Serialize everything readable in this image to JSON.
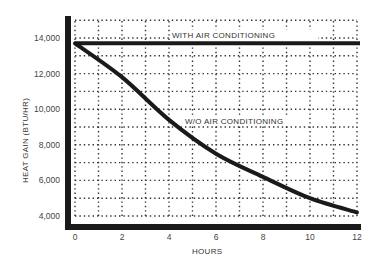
{
  "chart_data": {
    "type": "line",
    "title": "",
    "xlabel": "HOURS",
    "ylabel": "HEAT GAIN (BTU/HR)",
    "xlim": [
      0,
      12
    ],
    "ylim": [
      3600,
      15000
    ],
    "x_ticks": [
      0,
      2,
      4,
      6,
      8,
      10,
      12
    ],
    "x_tick_labels": [
      "0",
      "2",
      "4",
      "6",
      "8",
      "10",
      "12"
    ],
    "y_ticks": [
      4000,
      6000,
      8000,
      10000,
      12000,
      14000
    ],
    "y_tick_labels": [
      "4,000",
      "6,000",
      "8,000",
      "10,000",
      "12,000",
      "14,000"
    ],
    "grid": "dotted, every 1 hour and every 1,000 BTU/HR",
    "legend": "inline labels",
    "x": [
      0,
      2,
      4,
      6,
      8,
      10,
      12
    ],
    "series": [
      {
        "name": "WITH AIR CONDITIONING",
        "values": [
          13700,
          13700,
          13700,
          13700,
          13700,
          13700,
          13700
        ]
      },
      {
        "name": "W/O AIR CONDITIONING",
        "values": [
          13700,
          11800,
          9400,
          7500,
          6200,
          5000,
          4200
        ]
      }
    ],
    "annotations": [
      "WITH AIR CONDITIONING",
      "W/O AIR CONDITIONING"
    ]
  },
  "labels": {
    "with_ac": "WITH AIR CONDITIONING",
    "without_ac": "W/O AIR CONDITIONING",
    "xlabel": "HOURS",
    "ylabel": "HEAT GAIN (BTU/HR)"
  }
}
